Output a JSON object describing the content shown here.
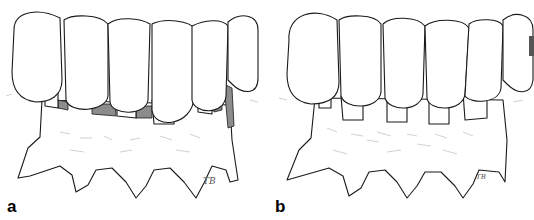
{
  "figure": {
    "panels": [
      {
        "id": "a",
        "label": "a",
        "signature": "TB",
        "shaded_gaps": true
      },
      {
        "id": "b",
        "label": "b",
        "signature": "TB",
        "shaded_gaps": false
      }
    ],
    "colors": {
      "line": "#1a1a1a",
      "shade": "#8c8c8c",
      "background": "#ffffff",
      "gum_stipple": "#bdbdbd"
    }
  }
}
